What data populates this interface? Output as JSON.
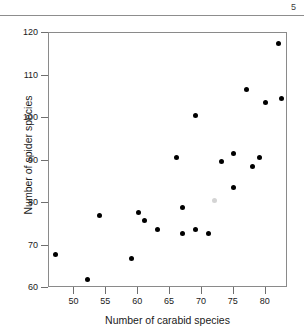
{
  "page": {
    "number": "5"
  },
  "chart_data": {
    "type": "scatter",
    "title": "",
    "xlabel": "Number of carabid species",
    "ylabel": "Number of spider species",
    "xlim": [
      46,
      83.5
    ],
    "ylim": [
      60,
      120
    ],
    "xticks": [
      50,
      55,
      60,
      65,
      70,
      75,
      80
    ],
    "xtick_labels": [
      "50",
      "55",
      "60",
      "65",
      "70",
      "75",
      "80"
    ],
    "yticks": [
      60,
      70,
      80,
      90,
      100,
      110,
      120
    ],
    "ytick_labels": [
      "60",
      "70",
      "80",
      "90",
      "100",
      "110",
      "120"
    ],
    "grid": false,
    "legend": null,
    "marker": "filled-circle",
    "marker_color": "#000000",
    "faint_marker_color": "#d4d4d4",
    "points": [
      {
        "x": 47,
        "y": 68.0,
        "faint": false
      },
      {
        "x": 52,
        "y": 62.0,
        "faint": false
      },
      {
        "x": 54,
        "y": 77.0,
        "faint": false
      },
      {
        "x": 59,
        "y": 67.0,
        "faint": false
      },
      {
        "x": 60,
        "y": 77.8,
        "faint": false
      },
      {
        "x": 61,
        "y": 75.8,
        "faint": false
      },
      {
        "x": 63,
        "y": 73.7,
        "faint": false
      },
      {
        "x": 66,
        "y": 90.7,
        "faint": false
      },
      {
        "x": 67,
        "y": 78.9,
        "faint": false
      },
      {
        "x": 67,
        "y": 72.8,
        "faint": false
      },
      {
        "x": 69,
        "y": 100.7,
        "faint": false
      },
      {
        "x": 69,
        "y": 73.7,
        "faint": false
      },
      {
        "x": 71,
        "y": 72.8,
        "faint": false
      },
      {
        "x": 72,
        "y": 80.6,
        "faint": true
      },
      {
        "x": 73,
        "y": 89.7,
        "faint": false
      },
      {
        "x": 75,
        "y": 91.6,
        "faint": false
      },
      {
        "x": 75,
        "y": 83.7,
        "faint": false
      },
      {
        "x": 77,
        "y": 106.6,
        "faint": false
      },
      {
        "x": 78,
        "y": 88.6,
        "faint": false
      },
      {
        "x": 79,
        "y": 90.7,
        "faint": false
      },
      {
        "x": 80,
        "y": 103.7,
        "faint": false
      },
      {
        "x": 82,
        "y": 117.5,
        "faint": false
      },
      {
        "x": 82.5,
        "y": 104.7,
        "faint": false
      }
    ]
  }
}
